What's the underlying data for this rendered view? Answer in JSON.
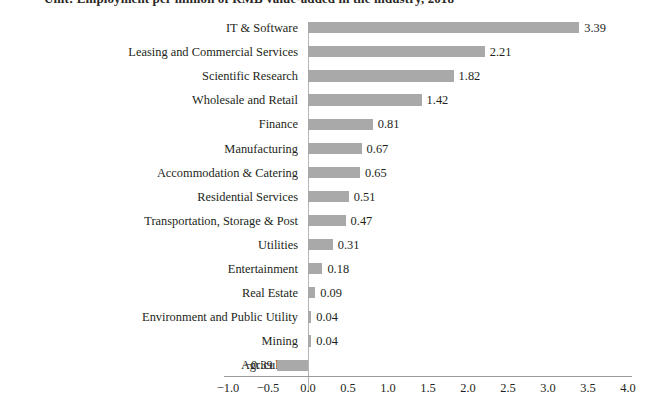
{
  "chart_data": {
    "type": "bar",
    "orientation": "horizontal",
    "title": "Unit: Employment per million of RMB value-added in the industry, 2018",
    "xlabel": "",
    "ylabel": "",
    "xlim": [
      -1.0,
      4.0
    ],
    "xticks": [
      "−1.0",
      "−0.5",
      "0.0",
      "0.5",
      "1.0",
      "1.5",
      "2.0",
      "2.5",
      "3.0",
      "3.5",
      "4.0"
    ],
    "xtick_values": [
      -1.0,
      -0.5,
      0.0,
      0.5,
      1.0,
      1.5,
      2.0,
      2.5,
      3.0,
      3.5,
      4.0
    ],
    "grid": false,
    "legend": null,
    "bar_color": "#a9a9a9",
    "categories": [
      "IT & Software",
      "Leasing and Commercial Services",
      "Scientific Research",
      "Wholesale and Retail",
      "Finance",
      "Manufacturing",
      "Accommodation & Catering",
      "Residential Services",
      "Transportation, Storage & Post",
      "Utilities",
      "Entertainment",
      "Real Estate",
      "Environment and Public Utility",
      "Mining",
      "Agriculture"
    ],
    "values": [
      3.39,
      2.21,
      1.82,
      1.42,
      0.81,
      0.67,
      0.65,
      0.51,
      0.47,
      0.31,
      0.18,
      0.09,
      0.04,
      0.04,
      -0.39
    ],
    "value_labels": [
      "3.39",
      "2.21",
      "1.82",
      "1.42",
      "0.81",
      "0.67",
      "0.65",
      "0.51",
      "0.47",
      "0.31",
      "0.18",
      "0.09",
      "0.04",
      "0.04",
      "−0.39"
    ]
  }
}
